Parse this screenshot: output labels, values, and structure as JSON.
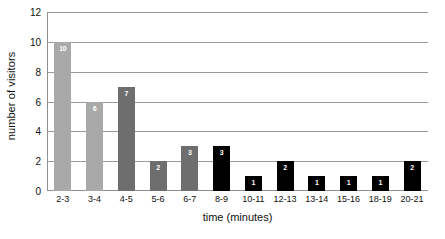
{
  "chart_data": {
    "type": "bar",
    "title": "",
    "xlabel": "time (minutes)",
    "ylabel": "number of visitors",
    "categories": [
      "2-3",
      "3-4",
      "4-5",
      "5-6",
      "6-7",
      "8-9",
      "10-11",
      "12-13",
      "13-14",
      "15-16",
      "18-19",
      "20-21"
    ],
    "values": [
      10,
      6,
      7,
      2,
      3,
      3,
      1,
      2,
      1,
      1,
      1,
      2
    ],
    "bar_colors": [
      "#a9a9a9",
      "#a9a9a9",
      "#6e6e6e",
      "#6e6e6e",
      "#6e6e6e",
      "#000000",
      "#000000",
      "#000000",
      "#000000",
      "#000000",
      "#000000",
      "#000000"
    ],
    "data_label_color": "#ffffff",
    "ylim": [
      0,
      12
    ],
    "yticks": [
      0,
      2,
      4,
      6,
      8,
      10,
      12
    ],
    "ytick_labels": [
      "0",
      "2",
      "4",
      "6",
      "8",
      "10",
      "12"
    ],
    "grid": true,
    "grid_axis": "y",
    "grid_color": "#9a9a9a",
    "legend": false,
    "background": "#ffffff"
  }
}
